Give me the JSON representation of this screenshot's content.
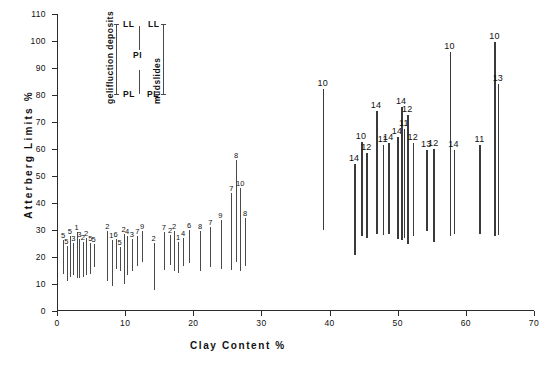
{
  "chart_data": {
    "type": "scatter",
    "title": "",
    "xlabel": "Clay  Content   %",
    "ylabel": "Atterberg  Limits",
    "ylabel_unit": "%",
    "xlim": [
      0,
      70
    ],
    "ylim": [
      0,
      110
    ],
    "xticks": [
      0,
      10,
      20,
      30,
      40,
      50,
      60,
      70
    ],
    "yticks": [
      0,
      10,
      20,
      30,
      40,
      50,
      60,
      70,
      80,
      90,
      100,
      110
    ],
    "grid": false,
    "legend_position": "top-left-inside",
    "series_note": "Each vertical bar spans Plastic Limit (PL, lower end) to Liquid Limit (LL, upper end); the span is the Plasticity Index (PI). Numbers above bars are site/sample reference numbers.",
    "groups": [
      {
        "name": "gelifluction deposits",
        "x_range": [
          0,
          30
        ]
      },
      {
        "name": "mudslides",
        "x_range": [
          38,
          65
        ]
      }
    ],
    "bars": [
      {
        "x": 0.9,
        "pl": 13.5,
        "ll": 26.0,
        "label": "5"
      },
      {
        "x": 1.4,
        "pl": 11.0,
        "ll": 24.0,
        "label": "5"
      },
      {
        "x": 1.9,
        "pl": 12.5,
        "ll": 27.5,
        "label": "5"
      },
      {
        "x": 2.4,
        "pl": 13.0,
        "ll": 25.0,
        "label": "3"
      },
      {
        "x": 2.9,
        "pl": 12.0,
        "ll": 29.0,
        "label": "1"
      },
      {
        "x": 3.3,
        "pl": 12.0,
        "ll": 26.5,
        "label": "3"
      },
      {
        "x": 3.8,
        "pl": 12.5,
        "ll": 25.5,
        "label": "2"
      },
      {
        "x": 4.3,
        "pl": 13.0,
        "ll": 27.0,
        "label": "2"
      },
      {
        "x": 4.9,
        "pl": 13.5,
        "ll": 25.0,
        "label": "5"
      },
      {
        "x": 5.4,
        "pl": 16.0,
        "ll": 24.5,
        "label": "5"
      },
      {
        "x": 7.4,
        "pl": 11.0,
        "ll": 29.5,
        "label": "2"
      },
      {
        "x": 8.0,
        "pl": 9.0,
        "ll": 26.0,
        "label": "1"
      },
      {
        "x": 8.6,
        "pl": 15.5,
        "ll": 26.5,
        "label": "6"
      },
      {
        "x": 9.2,
        "pl": 14.5,
        "ll": 23.5,
        "label": "5"
      },
      {
        "x": 9.8,
        "pl": 10.0,
        "ll": 28.5,
        "label": "2"
      },
      {
        "x": 10.3,
        "pl": 13.0,
        "ll": 27.5,
        "label": "4"
      },
      {
        "x": 11.0,
        "pl": 14.5,
        "ll": 26.5,
        "label": "3"
      },
      {
        "x": 11.8,
        "pl": 16.5,
        "ll": 27.5,
        "label": "7"
      },
      {
        "x": 12.5,
        "pl": 18.0,
        "ll": 29.5,
        "label": "9"
      },
      {
        "x": 14.2,
        "pl": 7.5,
        "ll": 25.0,
        "label": "2"
      },
      {
        "x": 15.7,
        "pl": 15.0,
        "ll": 29.0,
        "label": "7"
      },
      {
        "x": 16.6,
        "pl": 17.0,
        "ll": 28.0,
        "label": "2"
      },
      {
        "x": 17.2,
        "pl": 14.5,
        "ll": 29.5,
        "label": "2"
      },
      {
        "x": 17.8,
        "pl": 14.0,
        "ll": 25.5,
        "label": "1"
      },
      {
        "x": 18.5,
        "pl": 16.5,
        "ll": 27.0,
        "label": "4"
      },
      {
        "x": 19.4,
        "pl": 17.5,
        "ll": 30.0,
        "label": "6"
      },
      {
        "x": 21.0,
        "pl": 14.5,
        "ll": 29.5,
        "label": "8"
      },
      {
        "x": 22.5,
        "pl": 16.0,
        "ll": 31.0,
        "label": "7"
      },
      {
        "x": 24.0,
        "pl": 15.5,
        "ll": 33.5,
        "label": "9"
      },
      {
        "x": 25.6,
        "pl": 15.0,
        "ll": 43.5,
        "label": "7"
      },
      {
        "x": 26.3,
        "pl": 18.0,
        "ll": 56.0,
        "label": "8"
      },
      {
        "x": 26.9,
        "pl": 14.5,
        "ll": 45.5,
        "label": "10"
      },
      {
        "x": 27.6,
        "pl": 16.5,
        "ll": 34.5,
        "label": "8"
      },
      {
        "x": 39.0,
        "pl": 30.0,
        "ll": 82.0,
        "label": "10"
      },
      {
        "x": 43.6,
        "pl": 20.5,
        "ll": 54.5,
        "label": "14"
      },
      {
        "x": 44.6,
        "pl": 27.5,
        "ll": 62.5,
        "label": "10"
      },
      {
        "x": 45.4,
        "pl": 27.0,
        "ll": 58.5,
        "label": "12"
      },
      {
        "x": 46.8,
        "pl": 28.5,
        "ll": 74.0,
        "label": "14"
      },
      {
        "x": 47.8,
        "pl": 28.0,
        "ll": 61.5,
        "label": "11"
      },
      {
        "x": 48.6,
        "pl": 28.5,
        "ll": 62.0,
        "label": "14"
      },
      {
        "x": 49.9,
        "pl": 26.5,
        "ll": 64.5,
        "label": "14"
      },
      {
        "x": 50.5,
        "pl": 26.0,
        "ll": 75.5,
        "label": "14"
      },
      {
        "x": 50.9,
        "pl": 27.0,
        "ll": 67.5,
        "label": "11"
      },
      {
        "x": 51.4,
        "pl": 24.5,
        "ll": 72.5,
        "label": "12"
      },
      {
        "x": 52.2,
        "pl": 27.5,
        "ll": 62.0,
        "label": "12"
      },
      {
        "x": 54.2,
        "pl": 29.5,
        "ll": 59.5,
        "label": "13"
      },
      {
        "x": 55.2,
        "pl": 25.5,
        "ll": 60.0,
        "label": "12"
      },
      {
        "x": 57.6,
        "pl": 27.5,
        "ll": 96.0,
        "label": "10"
      },
      {
        "x": 58.2,
        "pl": 28.5,
        "ll": 59.5,
        "label": "14"
      },
      {
        "x": 62.0,
        "pl": 28.5,
        "ll": 61.5,
        "label": "11"
      },
      {
        "x": 64.2,
        "pl": 27.5,
        "ll": 99.5,
        "label": "10"
      },
      {
        "x": 64.7,
        "pl": 28.0,
        "ll": 84.0,
        "label": "13"
      }
    ]
  },
  "legend": {
    "group_left": "gelifluction deposits",
    "group_right": "mudslides",
    "ll_left": "LL",
    "pl_left": "PL",
    "ll_right": "LL",
    "pl_right": "PL",
    "pi": "PI"
  },
  "caption": ""
}
